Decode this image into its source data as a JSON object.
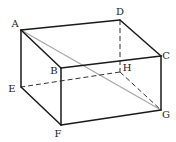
{
  "diagram": {
    "type": "rectangular-prism",
    "vertices": {
      "A": {
        "label": "A",
        "x": 21,
        "y": 30,
        "lx": 15,
        "ly": 27
      },
      "B": {
        "label": "B",
        "x": 61,
        "y": 68,
        "lx": 54,
        "ly": 74
      },
      "C": {
        "label": "C",
        "x": 161,
        "y": 56,
        "lx": 166,
        "ly": 59
      },
      "D": {
        "label": "D",
        "x": 120,
        "y": 20,
        "lx": 120,
        "ly": 15
      },
      "E": {
        "label": "E",
        "x": 21,
        "y": 87,
        "lx": 12,
        "ly": 92
      },
      "F": {
        "label": "F",
        "x": 61,
        "y": 125,
        "lx": 58,
        "ly": 137
      },
      "G": {
        "label": "G",
        "x": 161,
        "y": 110,
        "lx": 166,
        "ly": 118
      },
      "H": {
        "label": "H",
        "x": 120,
        "y": 72,
        "lx": 127,
        "ly": 71
      }
    },
    "edges_solid": [
      [
        "A",
        "D"
      ],
      [
        "D",
        "C"
      ],
      [
        "C",
        "B"
      ],
      [
        "B",
        "A"
      ],
      [
        "A",
        "E"
      ],
      [
        "E",
        "F"
      ],
      [
        "F",
        "G"
      ],
      [
        "G",
        "C"
      ],
      [
        "B",
        "F"
      ]
    ],
    "edges_hidden": [
      [
        "D",
        "H"
      ],
      [
        "H",
        "E"
      ],
      [
        "H",
        "G"
      ]
    ],
    "diagonal": [
      "A",
      "G"
    ],
    "colors": {
      "solid": "#1a1a1a",
      "hidden": "#333333",
      "diagonal": "#a8a8a8"
    }
  }
}
